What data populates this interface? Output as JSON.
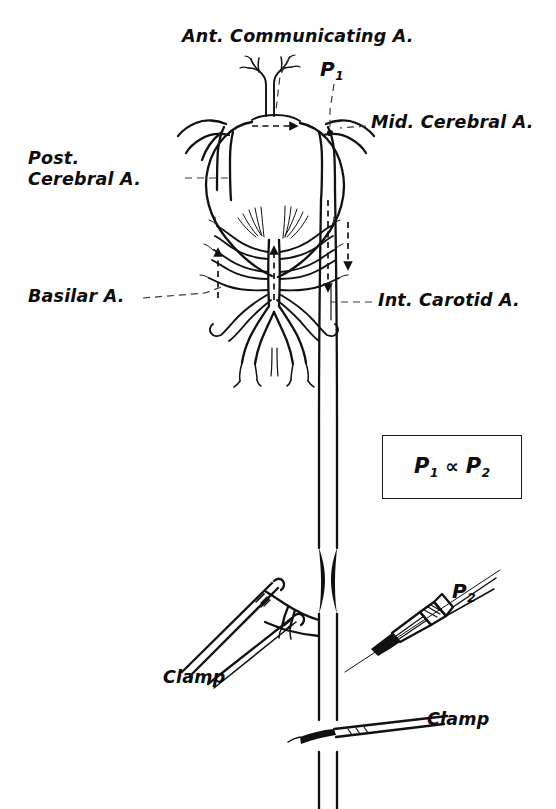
{
  "figure": {
    "kind": "anatomical-line-drawing",
    "background_color": "#ffffff",
    "ink_color": "#111111",
    "width": 556,
    "height": 809
  },
  "labels": {
    "ant_communicating": "Ant. Communicating A.",
    "mid_cerebral": "Mid. Cerebral A.",
    "post_cerebral_line1": "Post.",
    "post_cerebral_line2": "Cerebral A.",
    "basilar": "Basilar A.",
    "int_carotid": "Int. Carotid A.",
    "clamp_upper": "Clamp",
    "clamp_lower": "Clamp",
    "p1": "P",
    "p1_sub": "1",
    "p2": "P",
    "p2_sub": "2"
  },
  "formula": {
    "left_symbol": "P",
    "left_sub": "1",
    "operator": "∝",
    "right_symbol": "P",
    "right_sub": "2"
  },
  "annotations": {
    "flow_arrows": [
      {
        "name": "ant-communicating-flow",
        "direction": "rightward"
      },
      {
        "name": "left-vertebral-flow",
        "direction": "upward"
      },
      {
        "name": "basilar-flow",
        "direction": "upward"
      },
      {
        "name": "right-carotid-flow",
        "direction": "downward"
      },
      {
        "name": "right-posterior-flow",
        "direction": "downward"
      }
    ],
    "stenosis": {
      "name": "carotid-stenosis",
      "shape": "paired-black-wedges"
    },
    "needle": {
      "name": "pressure-needle",
      "label_ref": "p2"
    }
  }
}
